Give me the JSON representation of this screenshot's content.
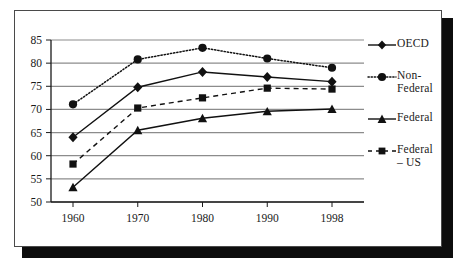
{
  "figure": {
    "frame_border_color": "#4a4a4a",
    "shadow_color": "#0d0d0d",
    "background": "#ffffff"
  },
  "chart_data": {
    "type": "line",
    "title": "",
    "subtitle": "",
    "xlabel": "",
    "ylabel": "",
    "categories": [
      "1960",
      "1970",
      "1980",
      "1990",
      "1998"
    ],
    "xtick_labels": [
      "1960",
      "1970",
      "1980",
      "1990",
      "1998"
    ],
    "ytick_labels": [
      "50",
      "55",
      "60",
      "65",
      "70",
      "75",
      "80",
      "85"
    ],
    "ytick_values": [
      50,
      55,
      60,
      65,
      70,
      75,
      80,
      85
    ],
    "ylim": [
      50,
      85
    ],
    "grid": "horizontal",
    "grid_color": "#8c8c8c",
    "axis_color": "#1a1a1a",
    "legend_position": "right",
    "series": [
      {
        "name": "OECD",
        "label": "OECD",
        "values": [
          64.0,
          74.8,
          78.1,
          77.0,
          76.0
        ],
        "line_style": "solid",
        "marker": "diamond",
        "color": "#111111"
      },
      {
        "name": "Non-Federal",
        "label": "Non-\nFederal",
        "values": [
          71.1,
          80.8,
          83.3,
          81.0,
          79.0
        ],
        "line_style": "dotted",
        "marker": "circle",
        "color": "#111111"
      },
      {
        "name": "Federal",
        "label": "Federal",
        "values": [
          53.2,
          65.5,
          68.1,
          69.6,
          70.1
        ],
        "line_style": "solid",
        "marker": "triangle",
        "color": "#111111"
      },
      {
        "name": "Federal - US",
        "label": "Federal\n– US",
        "values": [
          58.2,
          70.3,
          72.5,
          74.6,
          74.4
        ],
        "line_style": "dashed",
        "marker": "square",
        "color": "#111111"
      }
    ]
  }
}
